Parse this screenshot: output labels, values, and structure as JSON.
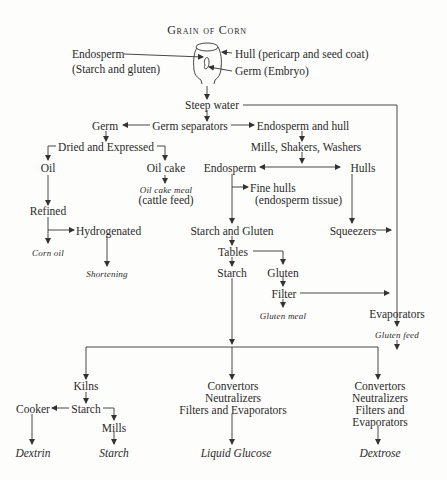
{
  "title": "Grain of Corn",
  "grain_labels": {
    "endosperm": "Endosperm",
    "endosperm_sub": "(Starch and gluten)",
    "hull": "Hull (pericarp and seed coat)",
    "germ": "Germ (Embryo)"
  },
  "nodes": {
    "steep_water": "Steep water",
    "germ": "Germ",
    "germ_separators": "Germ separators",
    "endosperm_and_hull": "Endosperm and hull",
    "mills_shakers_washers": "Mills, Shakers, Washers",
    "dried_expressed": "Dried and Expressed",
    "oil": "Oil",
    "oil_cake": "Oil cake",
    "oil_cake_meal": "Oil cake meal",
    "cattle_feed": "(cattle feed)",
    "endosperm": "Endosperm",
    "hulls": "Hulls",
    "fine_hulls": "Fine hulls",
    "fine_hulls_sub": "(endosperm tissue)",
    "refined": "Refined",
    "hydrogenated": "Hydrogenated",
    "corn_oil": "Corn oil",
    "shortening": "Shortening",
    "starch_and_gluten": "Starch and Gluten",
    "squeezers": "Squeezers",
    "tables": "Tables",
    "starch": "Starch",
    "gluten": "Gluten",
    "filter": "Filter",
    "gluten_meal": "Gluten meal",
    "evaporators": "Evaporators",
    "gluten_feed": "Gluten feed",
    "kilns": "Kilns",
    "cooker": "Cooker",
    "starch2": "Starch",
    "mills": "Mills",
    "dextrin": "Dextrin",
    "starch_product": "Starch",
    "convertors1": "Convertors",
    "neutralizers1": "Neutralizers",
    "filters_evap1": "Filters and Evaporators",
    "liquid_glucose": "Liquid Glucose",
    "convertors2": "Convertors",
    "neutralizers2": "Neutralizers",
    "filters_and2": "Filters and",
    "evaporators2": "Evaporators",
    "dextrose": "Dextrose"
  }
}
